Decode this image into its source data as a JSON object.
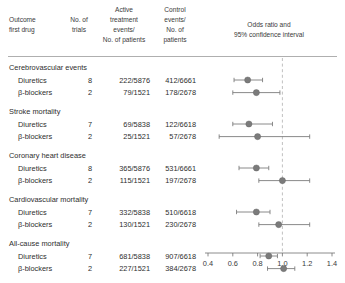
{
  "header": {
    "col_outcome": [
      "Outcome",
      "first drug"
    ],
    "col_trials": [
      "No. of",
      "trials"
    ],
    "col_active": [
      "Active",
      "treatment",
      "events/",
      "No. of patients"
    ],
    "col_control": [
      "Control",
      "events/",
      "No. of",
      "patients"
    ],
    "col_plot": [
      "Odds ratio and",
      "95% confidence interval"
    ]
  },
  "chart_data": {
    "type": "scatter",
    "title": "Odds ratio and 95% confidence interval",
    "xlabel": "",
    "ylabel": "",
    "xlim": [
      0.4,
      1.4
    ],
    "xticks": [
      0.4,
      0.6,
      0.8,
      1.0,
      1.2,
      1.4
    ],
    "xtick_labels": [
      "0.4",
      "0.6",
      "0.8",
      "1.0",
      "1.2",
      "1.4"
    ],
    "grid": false,
    "reference_line": 1.0,
    "marker_color": "#7b7b7b",
    "line_color": "#7d7d7d",
    "groups": [
      {
        "label": "Cerebrovascular events",
        "rows": [
          {
            "drug": "Diuretics",
            "trials": "8",
            "active": "222/5876",
            "control": "412/6661",
            "or": 0.72,
            "lo": 0.61,
            "hi": 0.84
          },
          {
            "drug": "β-blockers",
            "trials": "2",
            "active": "79/1521",
            "control": "178/2678",
            "or": 0.79,
            "lo": 0.6,
            "hi": 0.98
          }
        ]
      },
      {
        "label": "Stroke mortality",
        "rows": [
          {
            "drug": "Diuretics",
            "trials": "7",
            "active": "69/5838",
            "control": "122/6618",
            "or": 0.73,
            "lo": 0.6,
            "hi": 0.92
          },
          {
            "drug": "β-blockers",
            "trials": "2",
            "active": "25/1521",
            "control": "57/2678",
            "or": 0.8,
            "lo": 0.49,
            "hi": 1.22
          }
        ]
      },
      {
        "label": "Coronary heart disease",
        "rows": [
          {
            "drug": "Diuretics",
            "trials": "8",
            "active": "365/5876",
            "control": "531/6661",
            "or": 0.79,
            "lo": 0.65,
            "hi": 0.89
          },
          {
            "drug": "β-blockers",
            "trials": "2",
            "active": "115/1521",
            "control": "197/2678",
            "or": 1.0,
            "lo": 0.81,
            "hi": 1.22
          }
        ]
      },
      {
        "label": "Cardiovascular mortality",
        "rows": [
          {
            "drug": "Diuretics",
            "trials": "7",
            "active": "332/5838",
            "control": "510/6618",
            "or": 0.79,
            "lo": 0.63,
            "hi": 0.9
          },
          {
            "drug": "β-blockers",
            "trials": "2",
            "active": "130/1521",
            "control": "230/2678",
            "or": 0.97,
            "lo": 0.81,
            "hi": 1.22
          }
        ]
      },
      {
        "label": "All-cause mortality",
        "rows": [
          {
            "drug": "Diuretics",
            "trials": "7",
            "active": "681/5838",
            "control": "907/6618",
            "or": 0.89,
            "lo": 0.82,
            "hi": 0.96
          },
          {
            "drug": "β-blockers",
            "trials": "2",
            "active": "227/1521",
            "control": "384/2678",
            "or": 1.01,
            "lo": 0.88,
            "hi": 1.1
          }
        ]
      }
    ]
  },
  "layout": {
    "x_outcome": 9,
    "x_drug": 18,
    "x_trials_right": 92,
    "x_active_right": 150,
    "x_control_right": 196,
    "axis_x0": 208,
    "axis_x1": 332,
    "axis_y": 253,
    "plot_top": 60,
    "rule_y": 56,
    "first_row_y": 70,
    "row_gap": 12.6,
    "group_gap": 6.2,
    "marker_r": 3.1,
    "cap_h": 4.4
  }
}
